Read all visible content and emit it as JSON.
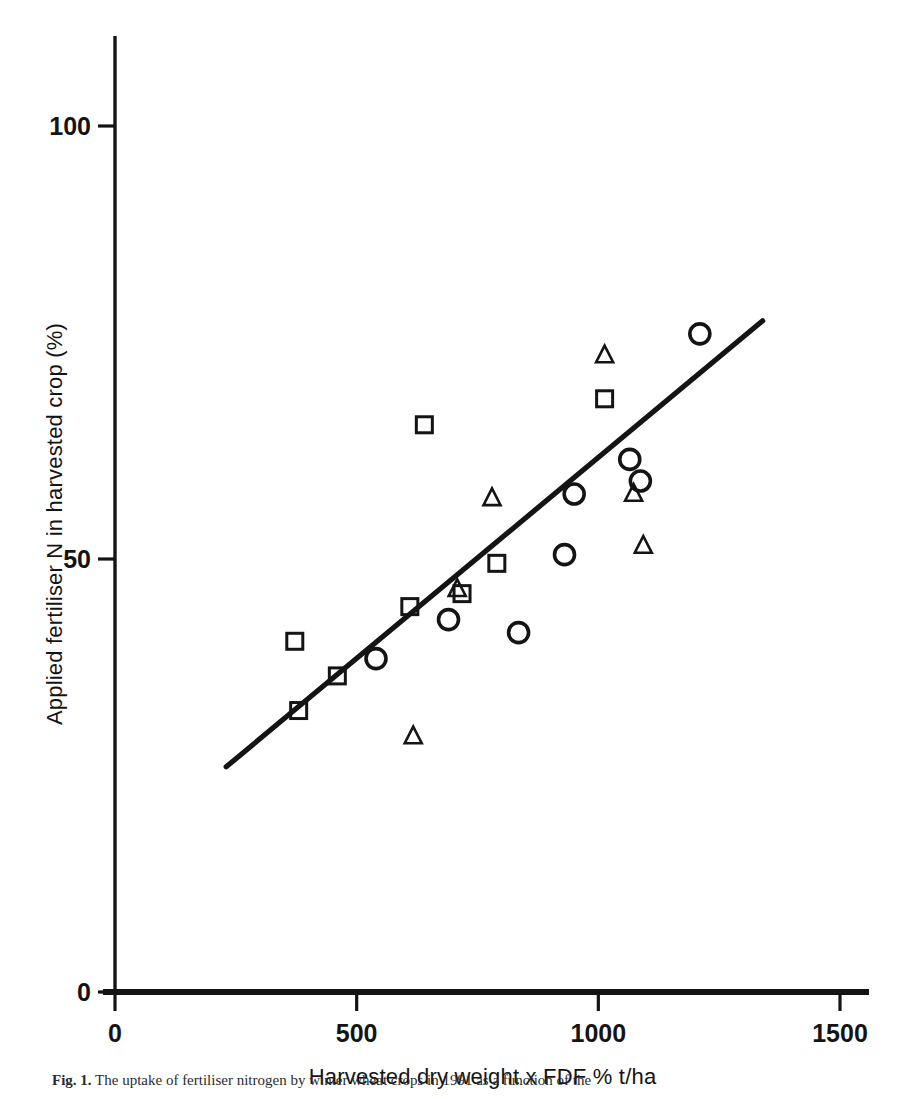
{
  "figure": {
    "caption_label": "Fig. 1.",
    "caption_text": "The uptake of fertiliser nitrogen by winter wheat crops in 1991 as a function of the"
  },
  "axes": {
    "x": {
      "title": "Harvested dry weight x FDF % t/ha",
      "ticks": [
        0,
        500,
        1000,
        1500
      ],
      "tick_labels": [
        "0",
        "500",
        "1000",
        "1500"
      ],
      "min": 0,
      "max": 1560
    },
    "y": {
      "title": "Applied fertiliser N in harvested crop (%)",
      "ticks": [
        0,
        50,
        100
      ],
      "tick_labels": [
        "0",
        "50",
        "100"
      ],
      "min": 0,
      "max": 114
    }
  },
  "chart_data": {
    "type": "scatter",
    "title": "",
    "xlabel": "Harvested dry weight x FDF % t/ha",
    "ylabel": "Applied fertiliser N in harvested crop (%)",
    "xlim": [
      0,
      1560
    ],
    "ylim": [
      0,
      114
    ],
    "xticks": [
      0,
      500,
      1000,
      1500
    ],
    "yticks": [
      0,
      50,
      100
    ],
    "grid": false,
    "legend": "none",
    "series": [
      {
        "name": "squares",
        "marker": "square",
        "points": [
          {
            "x": 372,
            "y": 40.5
          },
          {
            "x": 460,
            "y": 36.5
          },
          {
            "x": 380,
            "y": 32.5
          },
          {
            "x": 610,
            "y": 44.5
          },
          {
            "x": 640,
            "y": 65.5
          },
          {
            "x": 718,
            "y": 46.0
          },
          {
            "x": 790,
            "y": 49.5
          },
          {
            "x": 1013,
            "y": 68.5
          }
        ]
      },
      {
        "name": "circles",
        "marker": "circle",
        "points": [
          {
            "x": 540,
            "y": 38.5
          },
          {
            "x": 690,
            "y": 43.0
          },
          {
            "x": 835,
            "y": 41.5
          },
          {
            "x": 930,
            "y": 50.5
          },
          {
            "x": 950,
            "y": 57.5
          },
          {
            "x": 1065,
            "y": 61.5
          },
          {
            "x": 1087,
            "y": 59.0
          },
          {
            "x": 1210,
            "y": 76.0
          }
        ]
      },
      {
        "name": "triangles",
        "marker": "triangle",
        "points": [
          {
            "x": 617,
            "y": 29.5
          },
          {
            "x": 708,
            "y": 46.5
          },
          {
            "x": 780,
            "y": 57.0
          },
          {
            "x": 1013,
            "y": 73.5
          },
          {
            "x": 1073,
            "y": 57.5
          },
          {
            "x": 1093,
            "y": 51.5
          }
        ]
      }
    ],
    "fit_line": {
      "name": "regression-line",
      "x0": 230,
      "y0": 26.0,
      "x1": 1340,
      "y1": 77.5
    }
  }
}
